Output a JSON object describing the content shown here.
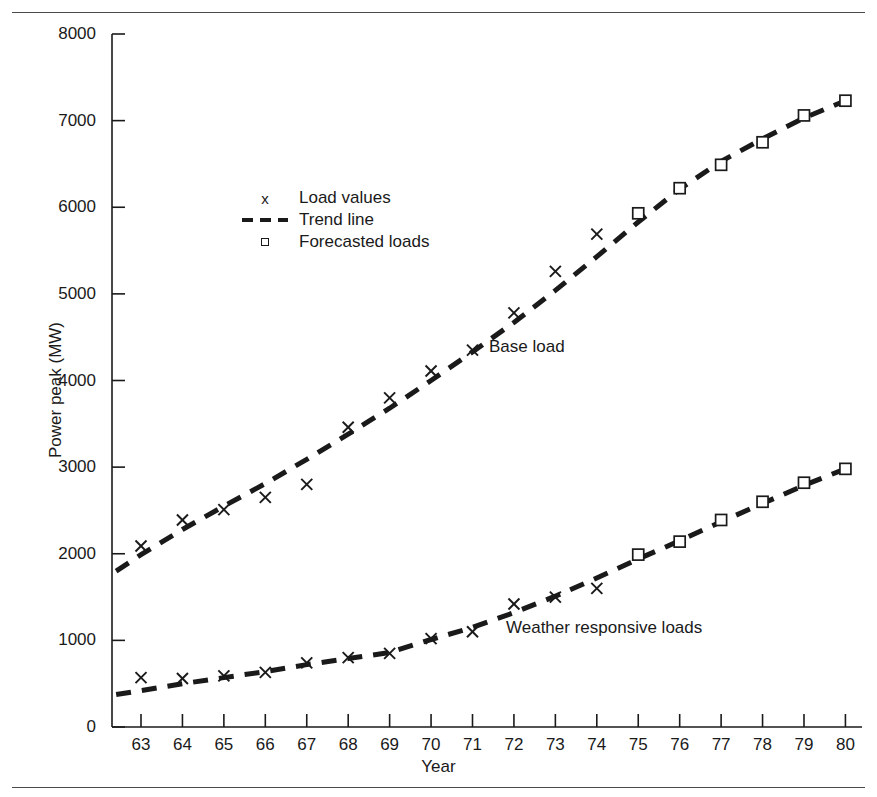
{
  "chart_data": {
    "type": "line",
    "title": "",
    "xlabel": "Year",
    "ylabel": "Power peak (MW)",
    "x": [
      63,
      64,
      65,
      66,
      67,
      68,
      69,
      70,
      71,
      72,
      73,
      74,
      75,
      76,
      77,
      78,
      79,
      80
    ],
    "xtick_labels": [
      "63",
      "64",
      "65",
      "66",
      "67",
      "68",
      "69",
      "70",
      "71",
      "72",
      "73",
      "74",
      "75",
      "76",
      "77",
      "78",
      "79",
      "80"
    ],
    "ytick_labels": [
      "0",
      "1000",
      "2000",
      "3000",
      "4000",
      "5000",
      "6000",
      "7000",
      "8000"
    ],
    "yticks": [
      0,
      1000,
      2000,
      3000,
      4000,
      5000,
      6000,
      7000,
      8000
    ],
    "xlim": [
      62.3,
      80.4
    ],
    "ylim": [
      0,
      8000
    ],
    "grid": false,
    "legend_position": "upper-left-inside",
    "series": [
      {
        "name": "Base load",
        "observed_years": [
          63,
          64,
          65,
          66,
          67,
          68,
          69,
          70,
          71,
          72,
          73,
          74
        ],
        "observed_values": [
          2090,
          2390,
          2510,
          2650,
          2800,
          3460,
          3800,
          4110,
          4350,
          4780,
          5260,
          5690
        ],
        "forecast_years": [
          75,
          76,
          77,
          78,
          79,
          80
        ],
        "forecast_values": [
          5930,
          6220,
          6490,
          6750,
          7060,
          7230
        ],
        "trend_years": [
          62.4,
          63,
          64,
          65,
          66,
          67,
          68,
          69,
          70,
          71,
          72,
          73,
          74,
          75,
          76,
          77,
          78,
          79,
          80
        ],
        "trend_values": [
          1800,
          1990,
          2280,
          2550,
          2810,
          3090,
          3380,
          3680,
          4000,
          4330,
          4670,
          5040,
          5430,
          5830,
          6210,
          6530,
          6790,
          7030,
          7230
        ]
      },
      {
        "name": "Weather responsive loads",
        "observed_years": [
          63,
          64,
          65,
          66,
          67,
          68,
          69,
          70,
          71,
          72,
          73,
          74
        ],
        "observed_values": [
          570,
          560,
          590,
          630,
          740,
          800,
          850,
          1020,
          1100,
          1420,
          1500,
          1600
        ],
        "forecast_years": [
          75,
          76,
          77,
          78,
          79,
          80
        ],
        "forecast_values": [
          1990,
          2140,
          2390,
          2600,
          2820,
          2980
        ],
        "trend_years": [
          62.4,
          63,
          64,
          65,
          66,
          67,
          68,
          69,
          70,
          71,
          72,
          73,
          74,
          75,
          76,
          77,
          78,
          79,
          80
        ],
        "trend_values": [
          375,
          420,
          500,
          570,
          640,
          720,
          790,
          860,
          1010,
          1150,
          1320,
          1510,
          1720,
          1940,
          2150,
          2370,
          2580,
          2790,
          2980
        ]
      }
    ],
    "annotations": [
      {
        "text": "Base load",
        "x": 71.5,
        "y": 4160
      },
      {
        "text": "Weather responsive loads",
        "x": 71.9,
        "y": 980
      }
    ]
  },
  "legend": {
    "items": [
      {
        "symbol": "x",
        "label": "Load values",
        "marker": "cross"
      },
      {
        "symbol": "---",
        "label": "Trend line",
        "marker": "dashed-line"
      },
      {
        "symbol": "square",
        "label": "Forecasted loads",
        "marker": "square"
      }
    ]
  },
  "axis_label_x": "Year",
  "axis_label_y": "Power peak (MW)"
}
